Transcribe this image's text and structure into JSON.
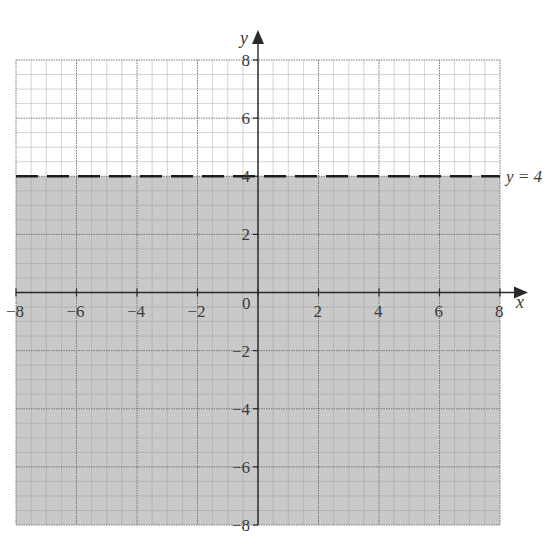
{
  "chart_data": {
    "type": "area",
    "title": "",
    "xlabel": "x",
    "ylabel": "y",
    "xlim": [
      -8,
      8
    ],
    "ylim": [
      -8,
      8
    ],
    "grid": true,
    "minor_grid_step": 0.5,
    "major_grid_step": 2,
    "x_ticks": [
      -8,
      -6,
      -4,
      -2,
      0,
      2,
      4,
      6,
      8
    ],
    "y_ticks": [
      -8,
      -6,
      -4,
      -2,
      2,
      4,
      6,
      8
    ],
    "x_tick_labels": [
      "−8",
      "−6",
      "−4",
      "−2",
      "0",
      "2",
      "4",
      "6",
      "8"
    ],
    "y_tick_labels": [
      "−8",
      "−6",
      "−4",
      "−2",
      "2",
      "4",
      "6",
      "8"
    ],
    "series": [
      {
        "name": "y = 4",
        "kind": "boundary-line",
        "equation": "y = 4",
        "style": "dashed",
        "x": [
          -8,
          8
        ],
        "y": [
          4,
          4
        ]
      },
      {
        "name": "shaded region",
        "kind": "inequality-region",
        "inequality": "y < 4",
        "fill": "#c9c9c9",
        "y_from": -8,
        "y_to": 4
      }
    ],
    "annotations": [
      {
        "text": "y = 4",
        "x": 8,
        "y": 4,
        "position": "right of line"
      }
    ]
  },
  "labels": {
    "x_axis": "x",
    "y_axis": "y",
    "line_label": "y = 4",
    "origin": "0"
  },
  "colors": {
    "shade": "#c9c9c9",
    "grid_minor": "#9a9a9a",
    "grid_major": "#6e6e6e",
    "axis": "#2a2a2a",
    "dashed_line": "#1e1e1e"
  }
}
